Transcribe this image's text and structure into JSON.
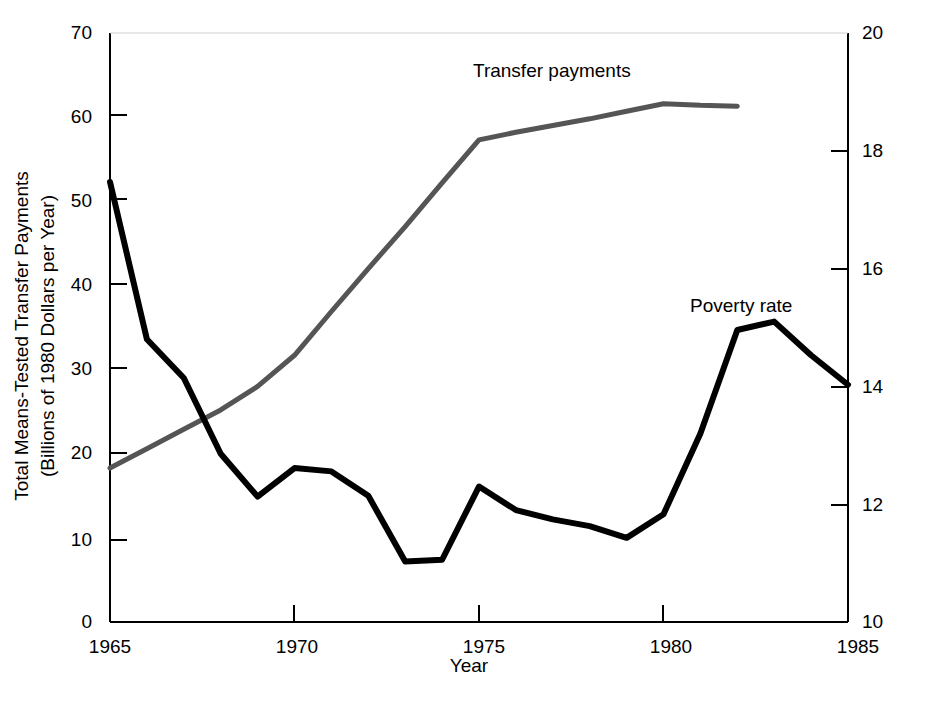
{
  "chart_data": {
    "type": "line",
    "title": "",
    "xlabel": "Year",
    "ylabel": "Total Means-Tested Transfer Payments\n(Billions of 1980 Dollars per Year)",
    "ylabel_line1": "Total Means-Tested Transfer Payments",
    "ylabel_line2": "(Billions of 1980 Dollars per Year)",
    "y2label": "Official Poverty Rate (Percent)",
    "xlim": [
      1965,
      1985
    ],
    "ylim": [
      0,
      70
    ],
    "y2lim": [
      10,
      20
    ],
    "xticks": [
      1965,
      1970,
      1975,
      1980,
      1985
    ],
    "xtick_labels": [
      "1965",
      "1970",
      "1975",
      "1980",
      "1985"
    ],
    "yticks": [
      0,
      10,
      20,
      30,
      40,
      50,
      60,
      70
    ],
    "ytick_labels": [
      "0",
      "10",
      "20",
      "30",
      "40",
      "50",
      "60",
      "70"
    ],
    "y2ticks": [
      10,
      12,
      14,
      16,
      18,
      20
    ],
    "y2tick_labels": [
      "10",
      "12",
      "14",
      "16",
      "18",
      "20"
    ],
    "grid": false,
    "legend_position": "inline-annotation",
    "series": [
      {
        "name": "Transfer payments",
        "color": "#555555",
        "axis": "left",
        "units": "Billions of 1980 Dollars per Year",
        "annotation_label": "Transfer payments",
        "x": [
          1965,
          1966,
          1967,
          1968,
          1969,
          1970,
          1971,
          1972,
          1973,
          1974,
          1975,
          1976,
          1977,
          1978,
          1979,
          1980,
          1981,
          1982
        ],
        "values": [
          18.3,
          20.6,
          22.9,
          25.2,
          28.0,
          31.7,
          36.9,
          42.0,
          47.0,
          52.2,
          57.3,
          58.2,
          59.0,
          59.8,
          60.7,
          61.6,
          61.4,
          61.3
        ]
      },
      {
        "name": "Poverty rate",
        "color": "#000000",
        "axis": "right",
        "units": "Percent",
        "annotation_label": "Poverty rate",
        "x": [
          1965,
          1966,
          1967,
          1968,
          1969,
          1970,
          1971,
          1972,
          1973,
          1974,
          1975,
          1976,
          1977,
          1978,
          1979,
          1980,
          1981,
          1982,
          1983,
          1984,
          1985
        ],
        "values_left_scale": [
          52.3,
          33.6,
          29.0,
          20.0,
          14.9,
          18.3,
          17.9,
          15.0,
          7.2,
          7.4,
          16.1,
          13.3,
          12.2,
          11.4,
          10.0,
          12.8,
          22.4,
          34.7,
          35.7,
          31.7,
          28.2
        ],
        "values": [
          17.5,
          14.5,
          13.9,
          12.8,
          12.0,
          12.6,
          12.5,
          12.0,
          10.8,
          10.9,
          12.4,
          11.9,
          11.7,
          11.5,
          11.2,
          11.6,
          13.2,
          15.2,
          15.4,
          14.8,
          14.0
        ]
      }
    ]
  },
  "annotations": {
    "transfer_payments_label": "Transfer payments",
    "poverty_rate_label": "Poverty rate"
  },
  "axes": {
    "left_title_line1": "Total Means-Tested Transfer Payments",
    "left_title_line2": "(Billions of 1980 Dollars per Year)",
    "right_title": "Official Poverty Rate (Percent)",
    "x_title": "Year"
  }
}
